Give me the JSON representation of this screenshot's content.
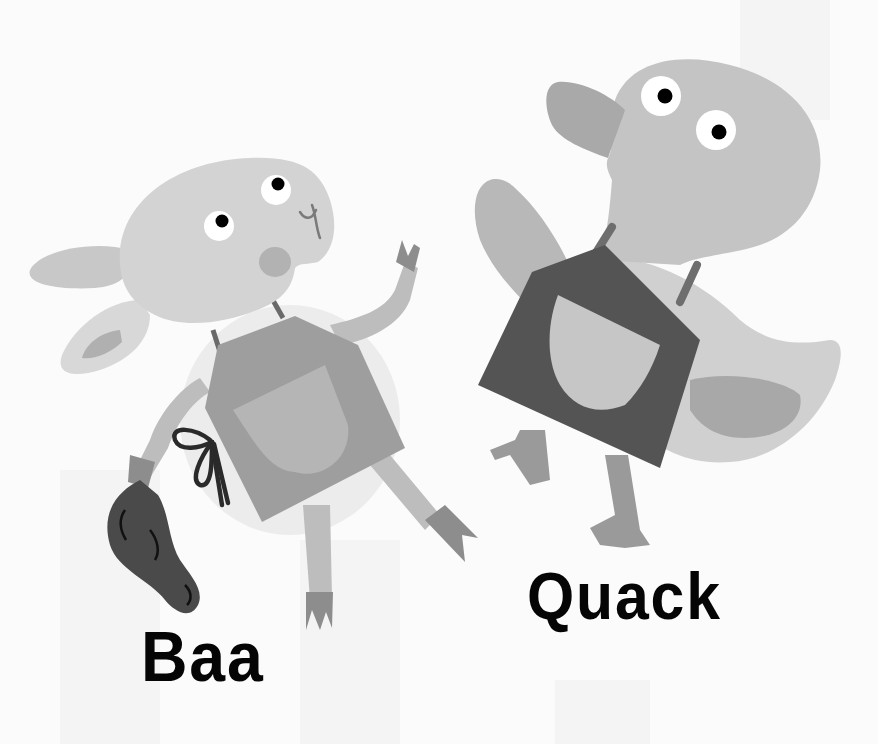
{
  "illustration": {
    "characters": [
      {
        "name": "lamb",
        "caption": "Baa",
        "wearing": "apron",
        "holding": "fish"
      },
      {
        "name": "duck",
        "caption": "Quack",
        "wearing": "apron"
      }
    ]
  },
  "captions": {
    "lamb": "Baa",
    "duck": "Quack"
  },
  "colors": {
    "background": "#fbfbfb",
    "lamb_body": "#d3d3d3",
    "lamb_apron": "#9e9e9e",
    "lamb_pocket": "#b5b5b5",
    "duck_body": "#c4c4c4",
    "duck_apron": "#545454",
    "duck_pocket": "#c6c6c6",
    "fish": "#4a4a4a",
    "text": "#050505"
  }
}
